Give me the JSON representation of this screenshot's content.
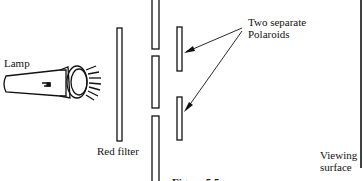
{
  "labels": {
    "lamp": "Lamp",
    "red_filter": "Red filter",
    "polaroids_line1": "Two separate",
    "polaroids_line2": "Polaroids",
    "viewing_line1": "Viewing",
    "viewing_line2": "surface"
  },
  "caption": "Figure 5.5"
}
